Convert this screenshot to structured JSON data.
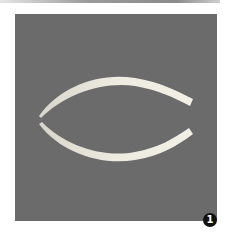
{
  "figure": {
    "label": "1",
    "background_color": "#6b6b6b",
    "object_color": "#e9e6d8"
  }
}
